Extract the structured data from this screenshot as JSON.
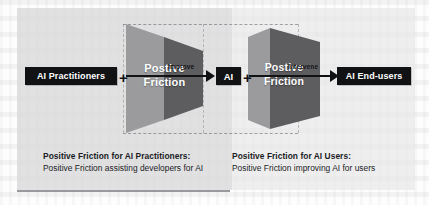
{
  "figure": {
    "type": "flow-diagram",
    "nodes": [
      {
        "id": "practitioners",
        "label": "AI Practitioners"
      },
      {
        "id": "ai",
        "label": "AI"
      },
      {
        "id": "endusers",
        "label": "AI End-users"
      }
    ],
    "operators": [
      {
        "id": "plus-1",
        "symbol": "+"
      },
      {
        "id": "plus-2",
        "symbol": "+"
      }
    ],
    "funnels": [
      {
        "id": "funnel-1",
        "line1": "Postive",
        "line2": "Friction"
      },
      {
        "id": "funnel-2",
        "line1": "Postive",
        "line2": "Friction"
      }
    ],
    "arrows": [
      {
        "id": "arrow-1",
        "label": "Improve"
      },
      {
        "id": "arrow-2",
        "label": "Intervene"
      }
    ],
    "captions": [
      {
        "id": "caption-left",
        "title": "Positive Friction for AI Practitioners:",
        "body": "Positive Friction assisting developers for AI"
      },
      {
        "id": "caption-right",
        "title": "Positive Friction for AI Users:",
        "body": "Positive Friction improving AI for users"
      }
    ],
    "colors": {
      "panel_background": "#e8e8e9",
      "panel_shade": "#cdcdd0",
      "node_fill": "#111214",
      "node_text": "#ffffff",
      "funnel_light": "#9b9b9e",
      "funnel_dark": "#5d5d60",
      "arrow": "#111214",
      "caption_text": "#1b1c1f",
      "rule": "#9a9a9e"
    }
  }
}
